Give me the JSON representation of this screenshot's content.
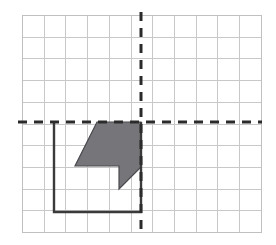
{
  "figure": {
    "canvas": {
      "width": 276,
      "height": 245,
      "background": "#ffffff"
    },
    "grid": {
      "origin_px": {
        "x": 22,
        "y": 15
      },
      "cell_px": 21.7,
      "columns": 11,
      "rows": 10,
      "line_color": "#c8c8c8",
      "line_width": 1,
      "border_color": "#c0c0c0"
    },
    "axes": {
      "style": "dashed",
      "color": "#2b2b2b",
      "line_width": 3,
      "dash_pattern": "9 7",
      "x_axis": {
        "label": "x-axis",
        "y_px": 122,
        "x_start_px": 18,
        "x_end_px": 262,
        "grid_row": 5
      },
      "y_axis": {
        "label": "y-axis",
        "x_px": 141,
        "y_start_px": 12,
        "y_end_px": 236,
        "grid_column": 5.5
      },
      "origin_px": {
        "x": 141,
        "y": 122
      }
    },
    "solid_square": {
      "label": "solid-black-square-outline",
      "stroke": "#3a3a3a",
      "stroke_width": 2.4,
      "fill": "none",
      "left_px": 54,
      "top_px": 122,
      "right_px": 141,
      "bottom_px": 212,
      "grid_cells_wide": 4,
      "grid_cells_tall": 4
    },
    "shaded_polygon": {
      "label": "shaded-grey-polygon",
      "fill": "#76767a",
      "stroke": "#4a4a4e",
      "stroke_width": 1.2,
      "points_px": [
        {
          "x": 97,
          "y": 122
        },
        {
          "x": 141,
          "y": 122
        },
        {
          "x": 141,
          "y": 167
        },
        {
          "x": 119,
          "y": 189
        },
        {
          "x": 119,
          "y": 166
        },
        {
          "x": 75,
          "y": 166
        }
      ],
      "points_attr": "97,122 141,122 141,167 119,189 119,166 75,166",
      "grid_points": [
        {
          "col": 3.45,
          "row": 5
        },
        {
          "col": 5.5,
          "row": 5
        },
        {
          "col": 5.5,
          "row": 7
        },
        {
          "col": 4.5,
          "row": 8
        },
        {
          "col": 4.5,
          "row": 7
        },
        {
          "col": 2.45,
          "row": 7
        }
      ]
    }
  }
}
